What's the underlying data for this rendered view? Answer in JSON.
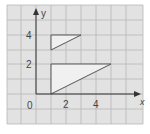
{
  "diagram": {
    "axes": {
      "x_label": "x",
      "y_label": "y",
      "origin_label": "0"
    },
    "x_ticks": [
      {
        "value": 2,
        "label": "2"
      },
      {
        "value": 4,
        "label": "4"
      }
    ],
    "y_ticks": [
      {
        "value": 2,
        "label": "2"
      },
      {
        "value": 4,
        "label": "4"
      }
    ],
    "shapes": [
      {
        "name": "upper-triangle",
        "vertices": [
          [
            1,
            3
          ],
          [
            1,
            4
          ],
          [
            3,
            4
          ]
        ]
      },
      {
        "name": "lower-triangle",
        "vertices": [
          [
            1,
            0
          ],
          [
            1,
            2
          ],
          [
            5,
            2
          ]
        ]
      }
    ],
    "colors": {
      "grid_bg": "#e2e2e2",
      "grid_line": "#b5b5b5",
      "shape_fill": "#f0f0f0",
      "stroke": "#444444"
    }
  }
}
